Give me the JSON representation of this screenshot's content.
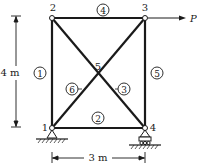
{
  "diagram": {
    "type": "truss",
    "nodes": [
      {
        "id": "1",
        "label": "1"
      },
      {
        "id": "2",
        "label": "2"
      },
      {
        "id": "3",
        "label": "3"
      },
      {
        "id": "4",
        "label": "4"
      },
      {
        "id": "5",
        "label": "5"
      }
    ],
    "members": [
      {
        "id": "m1",
        "label": "1"
      },
      {
        "id": "m2",
        "label": "2"
      },
      {
        "id": "m3",
        "label": "3"
      },
      {
        "id": "m4",
        "label": "4"
      },
      {
        "id": "m5",
        "label": "5"
      },
      {
        "id": "m6",
        "label": "6"
      }
    ],
    "load": {
      "label": "P"
    },
    "dimensions": {
      "height": "4 m",
      "width": "3 m"
    },
    "colors": {
      "line": "#1a1a1a",
      "background": "#ffffff"
    }
  }
}
